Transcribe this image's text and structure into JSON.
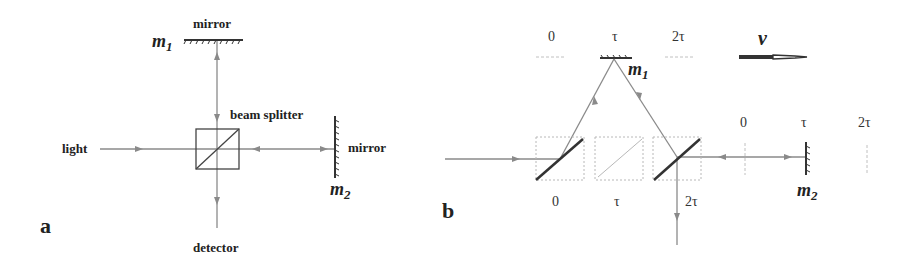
{
  "panel_a": {
    "label": "a",
    "texts": {
      "mirror_top": "mirror",
      "m1": "m",
      "m1_sub": "1",
      "beam_splitter": "beam splitter",
      "light": "light",
      "mirror_right": "mirror",
      "m2": "m",
      "m2_sub": "2",
      "detector": "detector"
    }
  },
  "panel_b": {
    "label": "b",
    "top_times": [
      "0",
      "τ",
      "2τ"
    ],
    "m1": "m",
    "m1_sub": "1",
    "velocity": "v",
    "right_times": [
      "0",
      "τ",
      "2τ"
    ],
    "m2": "m",
    "m2_sub": "2",
    "bottom_times": [
      "0",
      "τ",
      "2τ"
    ]
  },
  "colors": {
    "beam": "#8a8a8a",
    "solid": "#333333",
    "ghost": "#b8b8b8"
  }
}
